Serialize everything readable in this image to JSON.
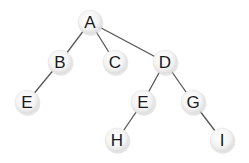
{
  "diagram": {
    "type": "tree",
    "colors": {
      "background": "#ffffff",
      "node_fill_light": "#ffffff",
      "node_fill_dark": "#d9d9d9",
      "node_text": "#1a1a1a",
      "edge": "#555555"
    },
    "nodes": [
      {
        "id": "A",
        "label": "A",
        "x": 90,
        "y": 22
      },
      {
        "id": "B",
        "label": "B",
        "x": 60,
        "y": 62
      },
      {
        "id": "C",
        "label": "C",
        "x": 115,
        "y": 62
      },
      {
        "id": "D",
        "label": "D",
        "x": 165,
        "y": 62
      },
      {
        "id": "E1",
        "label": "E",
        "x": 27,
        "y": 102
      },
      {
        "id": "E2",
        "label": "E",
        "x": 143,
        "y": 102
      },
      {
        "id": "G",
        "label": "G",
        "x": 193,
        "y": 102
      },
      {
        "id": "H",
        "label": "H",
        "x": 117,
        "y": 140
      },
      {
        "id": "I",
        "label": "I",
        "x": 222,
        "y": 140
      }
    ],
    "edges": [
      {
        "from": "A",
        "to": "B"
      },
      {
        "from": "A",
        "to": "C"
      },
      {
        "from": "A",
        "to": "D"
      },
      {
        "from": "B",
        "to": "E1"
      },
      {
        "from": "D",
        "to": "E2"
      },
      {
        "from": "D",
        "to": "G"
      },
      {
        "from": "E2",
        "to": "H"
      },
      {
        "from": "G",
        "to": "I"
      }
    ]
  }
}
